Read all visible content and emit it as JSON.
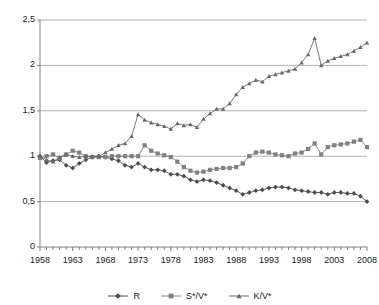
{
  "chart_data": {
    "type": "line",
    "title": "",
    "xlabel": "",
    "ylabel": "",
    "xlim": [
      1958,
      2008
    ],
    "ylim": [
      0,
      2.5
    ],
    "yticks": [
      0,
      0.5,
      1,
      1.5,
      2,
      2.5
    ],
    "ytick_labels": [
      "0",
      "0,5",
      "1",
      "1,5",
      "2",
      "2,5"
    ],
    "xticks": [
      1958,
      1963,
      1968,
      1973,
      1978,
      1983,
      1988,
      1993,
      1998,
      2003,
      2008
    ],
    "xtick_labels": [
      "1958",
      "1963",
      "1968",
      "1973",
      "1978",
      "1983",
      "1988",
      "1993",
      "1998",
      "2003",
      "2008"
    ],
    "grid": "horizontal",
    "legend_position": "bottom",
    "decimal_separator": ",",
    "x": [
      1958,
      1959,
      1960,
      1961,
      1962,
      1963,
      1964,
      1965,
      1966,
      1967,
      1968,
      1969,
      1970,
      1971,
      1972,
      1973,
      1974,
      1975,
      1976,
      1977,
      1978,
      1979,
      1980,
      1981,
      1982,
      1983,
      1984,
      1985,
      1986,
      1987,
      1988,
      1989,
      1990,
      1991,
      1992,
      1993,
      1994,
      1995,
      1996,
      1997,
      1998,
      1999,
      2000,
      2001,
      2002,
      2003,
      2004,
      2005,
      2006,
      2007,
      2008
    ],
    "series": [
      {
        "name": "R",
        "marker": "diamond",
        "color": "#4d4d4d",
        "values": [
          1.0,
          0.93,
          0.95,
          0.96,
          0.9,
          0.87,
          0.92,
          0.96,
          0.99,
          1.0,
          0.99,
          0.97,
          0.95,
          0.9,
          0.88,
          0.92,
          0.88,
          0.85,
          0.85,
          0.84,
          0.8,
          0.8,
          0.78,
          0.74,
          0.72,
          0.74,
          0.73,
          0.71,
          0.68,
          0.65,
          0.62,
          0.58,
          0.6,
          0.62,
          0.63,
          0.65,
          0.66,
          0.66,
          0.65,
          0.63,
          0.62,
          0.61,
          0.6,
          0.6,
          0.58,
          0.6,
          0.6,
          0.59,
          0.59,
          0.56,
          0.5
        ]
      },
      {
        "name": "S*/V*",
        "marker": "square",
        "color": "#808080",
        "values": [
          0.98,
          1.0,
          1.02,
          0.98,
          1.02,
          1.06,
          1.04,
          1.0,
          0.99,
          0.99,
          0.99,
          1.0,
          1.0,
          1.0,
          1.0,
          1.0,
          1.12,
          1.06,
          1.03,
          1.01,
          0.99,
          0.94,
          0.88,
          0.84,
          0.82,
          0.83,
          0.85,
          0.86,
          0.87,
          0.87,
          0.88,
          0.92,
          1.0,
          1.04,
          1.05,
          1.04,
          1.02,
          1.01,
          1.0,
          1.03,
          1.04,
          1.08,
          1.14,
          1.02,
          1.1,
          1.12,
          1.13,
          1.14,
          1.16,
          1.18,
          1.1
        ]
      },
      {
        "name": "K/V*",
        "marker": "triangle",
        "color": "#696969",
        "values": [
          1.0,
          0.96,
          0.94,
          0.99,
          1.02,
          1.0,
          0.99,
          1.0,
          1.0,
          1.0,
          1.04,
          1.08,
          1.12,
          1.14,
          1.22,
          1.46,
          1.4,
          1.37,
          1.35,
          1.33,
          1.3,
          1.36,
          1.34,
          1.35,
          1.32,
          1.41,
          1.47,
          1.52,
          1.52,
          1.58,
          1.68,
          1.76,
          1.8,
          1.84,
          1.82,
          1.88,
          1.9,
          1.92,
          1.94,
          1.96,
          2.03,
          2.12,
          2.3,
          2.0,
          2.05,
          2.08,
          2.1,
          2.12,
          2.16,
          2.2,
          2.25
        ]
      }
    ]
  },
  "legend": {
    "items": [
      {
        "label": "R"
      },
      {
        "label": "S*/V*"
      },
      {
        "label": "K/V*"
      }
    ]
  },
  "colors": {
    "axis": "#808080",
    "grid": "#b3b3b3",
    "text": "#1a1a1a",
    "plot_background": "#ffffff"
  }
}
